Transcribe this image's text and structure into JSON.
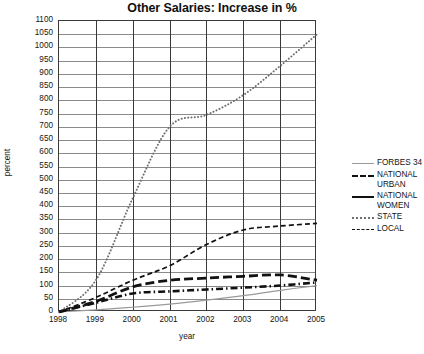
{
  "chart_data": {
    "type": "line",
    "title": "Other Salaries: Increase in %",
    "xlabel": "year",
    "ylabel": "percent",
    "grid": true,
    "legend_position": "right",
    "categories": [
      "1998",
      "1999",
      "2000",
      "2001",
      "2002",
      "2003",
      "2004",
      "2005"
    ],
    "x": [
      1998,
      1999,
      2000,
      2001,
      2002,
      2003,
      2004,
      2005
    ],
    "xlim": [
      1998,
      2005
    ],
    "ylim": [
      0,
      1100
    ],
    "ytick_step": 50,
    "yticks": [
      0,
      50,
      100,
      150,
      200,
      250,
      300,
      350,
      400,
      450,
      500,
      550,
      600,
      650,
      700,
      750,
      800,
      850,
      900,
      950,
      1000,
      1050,
      1100
    ],
    "series": [
      {
        "name": "FORBES 34",
        "style": "solid-thin-gray",
        "color": "#9a9a9a",
        "values": [
          0,
          8,
          18,
          30,
          45,
          62,
          82,
          100
        ]
      },
      {
        "name": "NATIONAL URBAN",
        "style": "dash-dot",
        "color": "#111111",
        "values": [
          0,
          35,
          70,
          78,
          85,
          92,
          100,
          112
        ]
      },
      {
        "name": "NATIONAL WOMEN",
        "style": "dashed-thick",
        "color": "#111111",
        "values": [
          0,
          40,
          95,
          120,
          128,
          135,
          140,
          120
        ]
      },
      {
        "name": "STATE",
        "style": "dotted",
        "color": "#6f6f6f",
        "values": [
          0,
          120,
          430,
          700,
          745,
          820,
          930,
          1050
        ]
      },
      {
        "name": "LOCAL",
        "style": "dashed-thin",
        "color": "#111111",
        "values": [
          0,
          55,
          120,
          175,
          255,
          310,
          325,
          335
        ]
      }
    ]
  },
  "legend": {
    "items": [
      {
        "label": "FORBES 34"
      },
      {
        "label": "NATIONAL URBAN"
      },
      {
        "label": "NATIONAL WOMEN"
      },
      {
        "label": "STATE"
      },
      {
        "label": "LOCAL"
      }
    ]
  }
}
